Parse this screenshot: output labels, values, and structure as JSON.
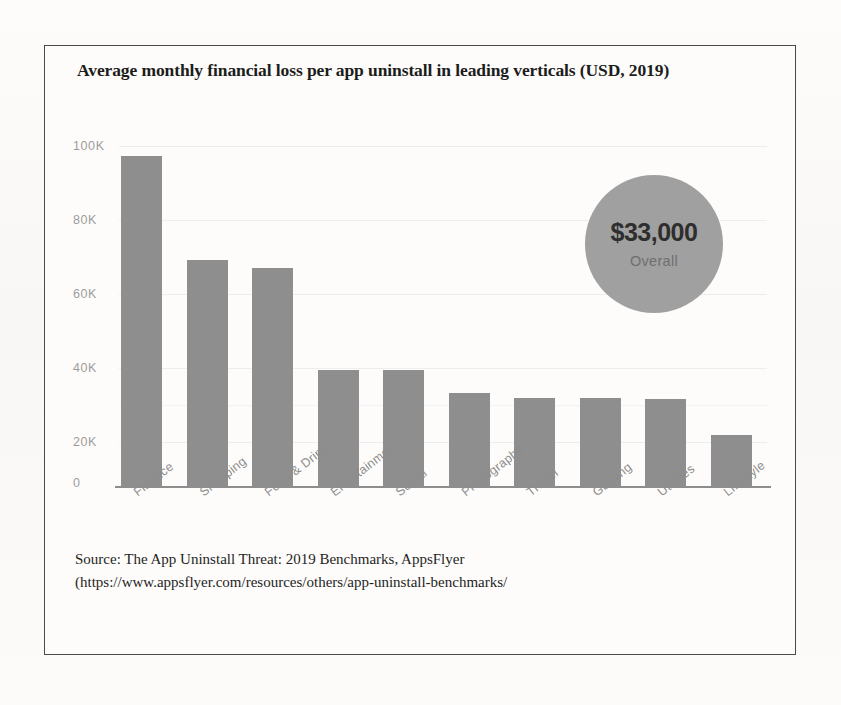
{
  "chart_data": {
    "type": "bar",
    "title": "Average monthly financial loss per app uninstall in leading verticals (USD, 2019)",
    "xlabel": "",
    "ylabel": "",
    "categories": [
      "Finance",
      "Shopping",
      "Food & Drink",
      "Entertainment",
      "Social",
      "Photography",
      "Travel",
      "Gaming",
      "Utilities",
      "Lifestyle"
    ],
    "values": [
      97000,
      66500,
      64000,
      34000,
      34000,
      27500,
      26000,
      26000,
      25500,
      15000
    ],
    "ylim": [
      0,
      100000
    ],
    "ytick_labels": [
      "100K",
      "80K",
      "60K",
      "40K",
      "20K",
      "0"
    ],
    "ytick_values": [
      100000,
      80000,
      60000,
      40000,
      20000,
      0
    ],
    "grid": true,
    "legend": "none",
    "bar_color": "#8e8e8e",
    "annotation": {
      "value": "$33,000",
      "caption": "Overall",
      "shape": "circle",
      "color": "#a0a0a0"
    }
  },
  "source": {
    "line1": "Source: The  App Uninstall Threat: 2019 Benchmarks, AppsFlyer",
    "line2": "(https://www.appsflyer.com/resources/others/app-uninstall-benchmarks/"
  }
}
